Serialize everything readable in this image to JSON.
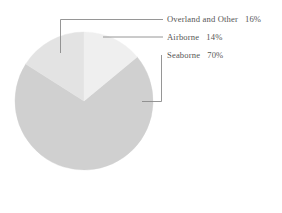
{
  "chart_data": {
    "type": "pie",
    "title": "",
    "subtitle": "",
    "xlabel": "",
    "ylabel": "",
    "legend_position": "callout-labels-right",
    "grid": false,
    "total_percent": 100,
    "start_angle_deg": 0,
    "direction": "clockwise",
    "categories": [
      "Airborne",
      "Seaborne",
      "Overland and Other"
    ],
    "values": [
      14,
      70,
      16
    ],
    "slices": [
      {
        "label": "Airborne",
        "value": 14,
        "value_text": "14%",
        "color": "#efefef",
        "start_deg": 0,
        "end_deg": 50.4
      },
      {
        "label": "Seaborne",
        "value": 70,
        "value_text": "70%",
        "color": "#d0d0d0",
        "start_deg": 50.4,
        "end_deg": 302.4
      },
      {
        "label": "Overland and Other",
        "value": 16,
        "value_text": "16%",
        "color": "#e3e3e3",
        "start_deg": 302.4,
        "end_deg": 360
      }
    ]
  },
  "labels": {
    "overland": {
      "name": "Overland and Other",
      "percent": "16%"
    },
    "airborne": {
      "name": "Airborne",
      "percent": "14%"
    },
    "seaborne": {
      "name": "Seaborne",
      "percent": "70%"
    }
  },
  "colors": {
    "background": "#ffffff",
    "text": "#565656",
    "leader_line": "#8a8a8a",
    "slice_airborne": "#efefef",
    "slice_seaborne": "#d0d0d0",
    "slice_overland": "#e3e3e3"
  },
  "footer": {
    "clipped_caption": ""
  }
}
